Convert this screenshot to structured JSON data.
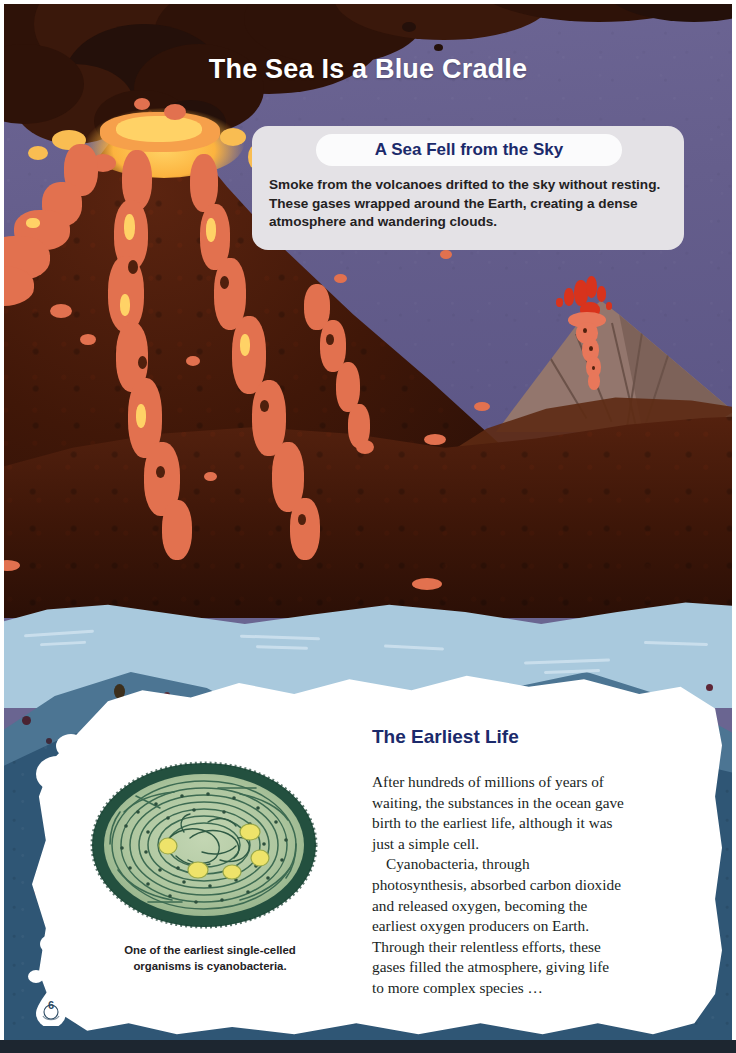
{
  "page": {
    "title": "The Sea Is a Blue Cradle",
    "number": "6"
  },
  "callout": {
    "heading": "A Sea Fell from the Sky",
    "body": "Smoke from the volcanoes drifted to the sky without resting. These gases wrapped around the Earth, creating a dense atmosphere and wandering clouds."
  },
  "section": {
    "heading": "The Earliest Life",
    "paragraphs": [
      "After hundreds of millions of years of waiting, the substances in the ocean gave birth to the earliest life, although it was just a simple cell.",
      "Cyanobacteria, through photosynthesis, absorbed carbon dioxide and released oxygen, becoming the earliest oxygen producers on Earth. Through their relentless efforts, these gases filled the atmosphere, giving life to more complex species …"
    ]
  },
  "figure": {
    "caption": "One of the earliest single-celled organisms is cyanobacteria."
  },
  "illustration": {
    "scene": "erupting-volcanoes-over-primordial-ocean",
    "elements": [
      "smoke-plume",
      "main-volcano",
      "lava-flows",
      "distant-volcano",
      "ocean-waves",
      "torn-paper-panel"
    ]
  },
  "colors": {
    "sky": "#6a6591",
    "smoke": "#2e1208",
    "volcano_rock": "#401708",
    "lava": "#e2714f",
    "lava_hot": "#ffd266",
    "ocean_light": "#a9c9dd",
    "ocean_mid": "#4c7593",
    "ocean_deep": "#2f5675",
    "heading_navy": "#1b2a6b",
    "paper": "#ffffff",
    "callout_bg": "#e4e2e6",
    "cell_green": "#a9c39a",
    "cell_rim": "#23503f",
    "granule_yellow": "#eee36a"
  }
}
